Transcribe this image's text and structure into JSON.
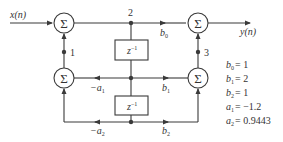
{
  "diagram": {
    "input_label": "x(n)",
    "output_label": "y(n)",
    "sum_symbol": "Σ",
    "delay_label": "z",
    "delay_exp": "−1",
    "node_labels": {
      "n1": "1",
      "n2": "2",
      "n3": "3"
    },
    "gains": {
      "b0": {
        "sym": "b",
        "sub": "0"
      },
      "b1": {
        "sym": "b",
        "sub": "1"
      },
      "b2": {
        "sym": "b",
        "sub": "2"
      },
      "a1": {
        "sym": "−a",
        "sub": "1"
      },
      "a2": {
        "sym": "−a",
        "sub": "2"
      }
    },
    "coefficients": [
      {
        "sym": "b",
        "sub": "0",
        "value": "= 1"
      },
      {
        "sym": "b",
        "sub": "1",
        "value": "= 2"
      },
      {
        "sym": "b",
        "sub": "2",
        "value": "= 1"
      },
      {
        "sym": "a",
        "sub": "1",
        "value": "= −1.2"
      },
      {
        "sym": "a",
        "sub": "2",
        "value": "= 0.9443"
      }
    ],
    "colors": {
      "line": "#3a3a3a",
      "text": "#333333",
      "background": "#ffffff"
    }
  }
}
